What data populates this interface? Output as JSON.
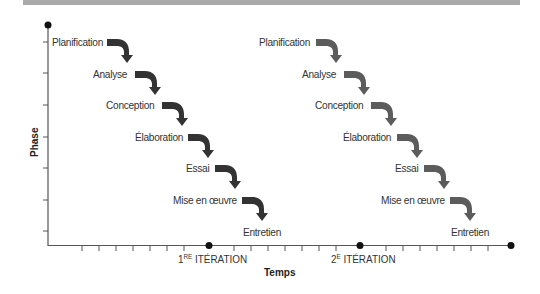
{
  "diagram": {
    "type": "iterative-waterfall",
    "y_axis_label": "Phase",
    "x_axis_label": "Temps",
    "iterations": [
      {
        "label_num": "1",
        "label_sup": "RE",
        "label_text": " ITÉRATION",
        "arrow_color": "#333333",
        "phases": [
          "Planification",
          "Analyse",
          "Conception",
          "Élaboration",
          "Essai",
          "Mise en œuvre",
          "Entretien"
        ]
      },
      {
        "label_num": "2",
        "label_sup": "E",
        "label_text": " ITÉRATION",
        "arrow_color": "#5c5c5c",
        "phases": [
          "Planification",
          "Analyse",
          "Conception",
          "Élaboration",
          "Essai",
          "Mise en œuvre",
          "Entretien"
        ]
      }
    ],
    "colors": {
      "axis": "#555555",
      "topbar": "#a9a9a9",
      "dot": "#111111"
    }
  }
}
